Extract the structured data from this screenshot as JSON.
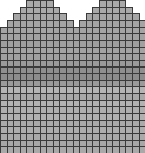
{
  "chart": {
    "title": "",
    "cols": 22,
    "rows": 23,
    "cell_w": 6.6,
    "cell_h": 6.65,
    "row_starts": [
      [
        4,
        8
      ],
      [
        3,
        9
      ],
      [
        2,
        10
      ],
      [
        1,
        11
      ],
      [
        0,
        22
      ],
      [
        0,
        22
      ],
      [
        0,
        22
      ],
      [
        0,
        22
      ],
      [
        0,
        22
      ],
      [
        0,
        22
      ],
      [
        0,
        22
      ],
      [
        0,
        22
      ],
      [
        0,
        22
      ],
      [
        0,
        22
      ],
      [
        0,
        22
      ],
      [
        0,
        22
      ],
      [
        0,
        22
      ],
      [
        0,
        22
      ],
      [
        0,
        22
      ],
      [
        0,
        22
      ],
      [
        0,
        22
      ],
      [
        0,
        22
      ],
      [
        0,
        22
      ]
    ],
    "right_hump": [
      [
        15,
        19
      ],
      [
        14,
        20
      ],
      [
        13,
        21
      ],
      [
        12,
        22
      ]
    ],
    "row_colors": [
      "#a9a9a9",
      "#a9a9a9",
      "#a6a6a6",
      "#a4a4a4",
      "#a4a4a4",
      "#a2a2a2",
      "#a0a0a0",
      "#a3a3a3",
      "#a0a0a0",
      "#9a9a9a",
      "#8f8f8f",
      "#8c8c8c",
      "#9a9a9a",
      "#b4b4b4",
      "#a8a8a8",
      "#b2b2b2",
      "#aeaeae",
      "#b0b0b0",
      "#aaaaaa",
      "#adadad",
      "#a9a9a9",
      "#a7a7a7",
      "#a9a9a9"
    ]
  }
}
